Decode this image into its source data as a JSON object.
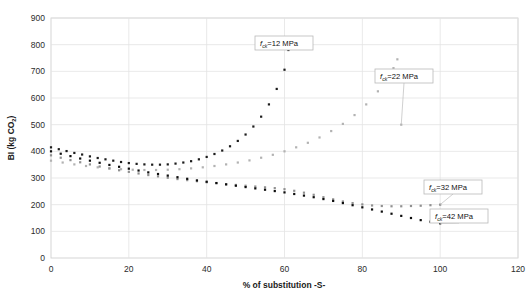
{
  "chart_data": {
    "type": "scatter",
    "title": "",
    "xlabel": "% of substitution -S-",
    "ylabel": "BI (kg CO2)",
    "ylabel_display": "BI (kg CO₂)",
    "xlim": [
      0,
      120
    ],
    "ylim": [
      0,
      900
    ],
    "xticks": [
      0,
      20,
      40,
      60,
      80,
      100,
      120
    ],
    "yticks": [
      0,
      100,
      200,
      300,
      400,
      500,
      600,
      700,
      800,
      900
    ],
    "grid": true,
    "grid_color": "#e3e3e3",
    "legend": "inline-callouts",
    "plot_background": "#ffffff",
    "marker": "square",
    "marker_size": 2.2,
    "series": [
      {
        "name": "fck=12 MPa",
        "label_prefix": "f",
        "label_sub": "ck",
        "label_suffix": "=12 MPa",
        "color": "#1c1c1c",
        "x": [
          0,
          2,
          4,
          6,
          8,
          10,
          12,
          14,
          16,
          18,
          20,
          22,
          24,
          26,
          28,
          30,
          32,
          34,
          36,
          38,
          40,
          42,
          44,
          46,
          48,
          50,
          52,
          54,
          56,
          58,
          60,
          61
        ],
        "y": [
          415,
          408,
          401,
          394,
          388,
          381,
          375,
          370,
          365,
          360,
          356,
          353,
          351,
          350,
          350,
          351,
          354,
          358,
          363,
          370,
          379,
          390,
          403,
          419,
          439,
          463,
          493,
          530,
          576,
          634,
          706,
          780
        ]
      },
      {
        "name": "fck=22 MPa",
        "label_prefix": "f",
        "label_sub": "ck",
        "label_suffix": "=22 MPa",
        "color": "#b2b2b2",
        "x": [
          0,
          3,
          6,
          9,
          12,
          15,
          18,
          21,
          24,
          27,
          30,
          33,
          36,
          39,
          42,
          45,
          48,
          51,
          54,
          57,
          60,
          63,
          66,
          69,
          72,
          75,
          78,
          81,
          84,
          86,
          88,
          89,
          90
        ],
        "y": [
          365,
          358,
          351,
          345,
          340,
          336,
          333,
          331,
          330,
          330,
          331,
          333,
          336,
          340,
          345,
          351,
          358,
          366,
          376,
          387,
          400,
          415,
          432,
          452,
          476,
          503,
          536,
          576,
          625,
          665,
          712,
          745,
          500
        ]
      },
      {
        "name": "fck=32 MPa",
        "label_prefix": "f",
        "label_sub": "ck",
        "label_suffix": "=32 MPa",
        "color": "#909090",
        "x": [
          0,
          2.5,
          5,
          7.5,
          10,
          12.5,
          15,
          17.5,
          20,
          22.5,
          25,
          27.5,
          30,
          32.5,
          35,
          37.5,
          40,
          42.5,
          45,
          47.5,
          50,
          52.5,
          55,
          57.5,
          60,
          62.5,
          65,
          67.5,
          70,
          72.5,
          75,
          77.5,
          80,
          82.5,
          85,
          87.5,
          90,
          92.5,
          95,
          97.5,
          100
        ],
        "y": [
          385,
          376,
          367,
          359,
          351,
          343,
          336,
          329,
          323,
          317,
          311,
          306,
          301,
          296,
          292,
          288,
          284,
          281,
          277,
          274,
          271,
          268,
          265,
          262,
          258,
          252,
          245,
          237,
          228,
          220,
          212,
          206,
          201,
          197,
          195,
          194,
          194,
          195,
          196,
          198,
          200
        ]
      },
      {
        "name": "fck=42 MPa",
        "label_prefix": "f",
        "label_sub": "ck",
        "label_suffix": "=42 MPa",
        "color": "#0d0d0d",
        "x": [
          0,
          2.5,
          5,
          7.5,
          10,
          12.5,
          15,
          17.5,
          20,
          22.5,
          25,
          27.5,
          30,
          32.5,
          35,
          37.5,
          40,
          42.5,
          45,
          47.5,
          50,
          52.5,
          55,
          57.5,
          60,
          62.5,
          65,
          67.5,
          70,
          72.5,
          75,
          77.5,
          80,
          82.5,
          85,
          87.5,
          90,
          92.5,
          95,
          97.5,
          100
        ],
        "y": [
          400,
          391,
          382,
          373,
          365,
          357,
          349,
          342,
          335,
          328,
          321,
          315,
          309,
          303,
          297,
          291,
          286,
          281,
          276,
          271,
          266,
          261,
          256,
          251,
          246,
          240,
          234,
          228,
          221,
          214,
          206,
          198,
          190,
          182,
          174,
          166,
          158,
          150,
          142,
          136,
          130
        ]
      }
    ],
    "annotations": [
      {
        "name": "callout-12",
        "text_prefix": "f",
        "text_sub": "ck",
        "text_suffix": "=12 MPa",
        "anchor_x": 61,
        "anchor_y": 780,
        "box_x": 255,
        "box_y": 36,
        "box_w": 58,
        "box_h": 14
      },
      {
        "name": "callout-22",
        "text_prefix": "f",
        "text_sub": "ck",
        "text_suffix": "=22 MPa",
        "anchor_x": 90,
        "anchor_y": 500,
        "box_x": 375,
        "box_y": 69,
        "box_w": 58,
        "box_h": 14
      },
      {
        "name": "callout-32",
        "text_prefix": "f",
        "text_sub": "ck",
        "text_suffix": "=32 MPa",
        "anchor_x": 100,
        "anchor_y": 200,
        "box_x": 424,
        "box_y": 180,
        "box_w": 58,
        "box_h": 14
      },
      {
        "name": "callout-42",
        "text_prefix": "f",
        "text_sub": "ck",
        "text_suffix": "=42 MPa",
        "anchor_x": 100,
        "anchor_y": 130,
        "box_x": 430,
        "box_y": 209,
        "box_w": 58,
        "box_h": 14
      }
    ]
  },
  "axis": {
    "x_title": "% of substitution -S-",
    "y_title_main": "BI (kg CO",
    "y_title_sub": "2",
    "y_title_close": ")"
  }
}
